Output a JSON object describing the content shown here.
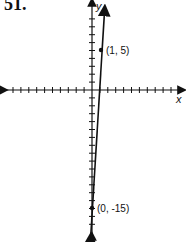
{
  "problem_number": "51.",
  "chart_data": {
    "type": "line",
    "title": "",
    "xlabel": "x",
    "ylabel": "y",
    "points": [
      {
        "x": 1,
        "y": 5,
        "label": "(1, 5)"
      },
      {
        "x": 0,
        "y": -15,
        "label": "(0, -15)"
      }
    ],
    "equation": "y = 20x - 15",
    "grid": false,
    "xlim": [
      -11,
      11
    ],
    "ylim": [
      -18,
      11
    ]
  }
}
